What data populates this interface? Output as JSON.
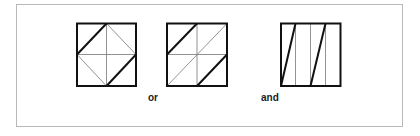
{
  "figure": {
    "labels": {
      "or": "or",
      "and": "and"
    },
    "colors": {
      "frame": "#b8b8b8",
      "thick_line": "#111111",
      "thin_line": "#777777"
    },
    "squares": [
      {
        "name": "square-diamond",
        "description": "square divided into quarters with inscribed diamond; two opposite diamond edges drawn thick"
      },
      {
        "name": "square-diagonal",
        "description": "square divided into quarters with one full diagonal; two corner diagonals drawn thick"
      },
      {
        "name": "square-stripes",
        "description": "square divided into four vertical strips; two slanted thick lines"
      }
    ]
  }
}
